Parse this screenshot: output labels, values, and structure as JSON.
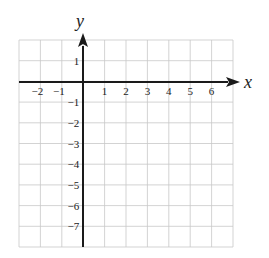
{
  "diagram": {
    "type": "coordinate-grid",
    "x_axis_label": "x",
    "y_axis_label": "y",
    "x_range": [
      -3,
      7
    ],
    "y_range": [
      -8,
      2
    ],
    "x_tick_labels": [
      "-2",
      "-1",
      "1",
      "2",
      "3",
      "4",
      "5",
      "6"
    ],
    "y_tick_labels": [
      "1",
      "-1",
      "-2",
      "-3",
      "-4",
      "-5",
      "-6",
      "-7"
    ],
    "colors": {
      "grid": "#c8c8c8",
      "axis": "#1a1a1a",
      "text": "#222222"
    }
  }
}
